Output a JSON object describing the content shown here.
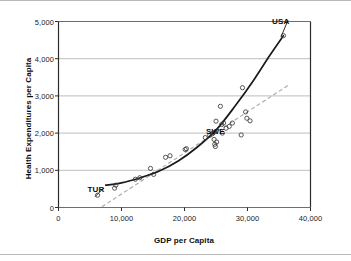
{
  "chart_data": {
    "type": "scatter",
    "title": "",
    "xlabel": "GDP per Capita",
    "ylabel": "Health Expenditures per Capita",
    "xlim": [
      0,
      40000
    ],
    "ylim": [
      0,
      5000
    ],
    "xticks": [
      "0",
      "10,000",
      "20,000",
      "30,000",
      "40,000"
    ],
    "xtick_values": [
      0,
      10000,
      20000,
      30000,
      40000
    ],
    "yticks": [
      "0",
      "1,000",
      "2,000",
      "3,000",
      "4,000",
      "5,000"
    ],
    "ytick_values": [
      0,
      1000,
      2000,
      3000,
      4000,
      5000
    ],
    "grid": "horizontal",
    "legend": "none",
    "points": [
      {
        "x": 6200,
        "y": 330
      },
      {
        "x": 8900,
        "y": 520
      },
      {
        "x": 9100,
        "y": 600
      },
      {
        "x": 12200,
        "y": 760
      },
      {
        "x": 12900,
        "y": 800
      },
      {
        "x": 14600,
        "y": 1050
      },
      {
        "x": 15100,
        "y": 890
      },
      {
        "x": 17000,
        "y": 1350
      },
      {
        "x": 17700,
        "y": 1390
      },
      {
        "x": 20100,
        "y": 1560
      },
      {
        "x": 20300,
        "y": 1580
      },
      {
        "x": 23300,
        "y": 1880
      },
      {
        "x": 24000,
        "y": 1940
      },
      {
        "x": 24400,
        "y": 1980
      },
      {
        "x": 24600,
        "y": 2010
      },
      {
        "x": 24700,
        "y": 1830
      },
      {
        "x": 24800,
        "y": 1700
      },
      {
        "x": 24900,
        "y": 1640
      },
      {
        "x": 25000,
        "y": 2320
      },
      {
        "x": 25100,
        "y": 1760
      },
      {
        "x": 25700,
        "y": 2720
      },
      {
        "x": 25900,
        "y": 2230
      },
      {
        "x": 26000,
        "y": 2000
      },
      {
        "x": 26200,
        "y": 2270
      },
      {
        "x": 26600,
        "y": 2130
      },
      {
        "x": 27100,
        "y": 2180
      },
      {
        "x": 27600,
        "y": 2270
      },
      {
        "x": 29000,
        "y": 1950
      },
      {
        "x": 29200,
        "y": 3220
      },
      {
        "x": 29700,
        "y": 2570
      },
      {
        "x": 29900,
        "y": 2400
      },
      {
        "x": 30400,
        "y": 2330
      },
      {
        "x": 35700,
        "y": 4620
      }
    ],
    "trend_exponential": {
      "style": "solid",
      "color": "#1a1a1a",
      "points": [
        {
          "x": 7500,
          "y": 600
        },
        {
          "x": 10000,
          "y": 660
        },
        {
          "x": 13000,
          "y": 800
        },
        {
          "x": 16000,
          "y": 980
        },
        {
          "x": 19000,
          "y": 1250
        },
        {
          "x": 22000,
          "y": 1620
        },
        {
          "x": 25000,
          "y": 2080
        },
        {
          "x": 28000,
          "y": 2720
        },
        {
          "x": 31000,
          "y": 3430
        },
        {
          "x": 33500,
          "y": 4080
        },
        {
          "x": 35700,
          "y": 4620
        }
      ]
    },
    "trend_linear": {
      "style": "dashed",
      "color": "#a8a8a8",
      "points": [
        {
          "x": 6900,
          "y": 20
        },
        {
          "x": 36500,
          "y": 3290
        }
      ]
    },
    "annotations": [
      {
        "label": "USA",
        "x": 35700,
        "y": 4620,
        "text_x": 33900,
        "text_y": 5000,
        "leader": true
      },
      {
        "label": "SWE",
        "x": 24600,
        "y": 2010,
        "text_x": 23400,
        "text_y": 2020,
        "leader": false
      },
      {
        "label": "TUR",
        "x": 6200,
        "y": 330,
        "text_x": 4600,
        "text_y": 480,
        "leader": true
      }
    ]
  }
}
